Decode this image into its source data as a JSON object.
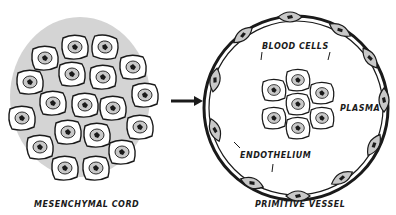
{
  "figure": {
    "left_panel": {
      "caption": "MESENCHYMAL CORD"
    },
    "arrow": {
      "direction": "right"
    },
    "right_panel": {
      "caption": "PRIMITIVE VESSEL",
      "labels": {
        "blood_cells": "BLOOD CELLS",
        "plasma": "PLASMA",
        "endothelium": "ENDOTHELIUM"
      }
    },
    "colors": {
      "ink": "#1a1a1a",
      "cell_fill": "#ffffff",
      "nucleus_fill": "#c8c8c8",
      "background_tint": "#d4d4d4"
    }
  }
}
